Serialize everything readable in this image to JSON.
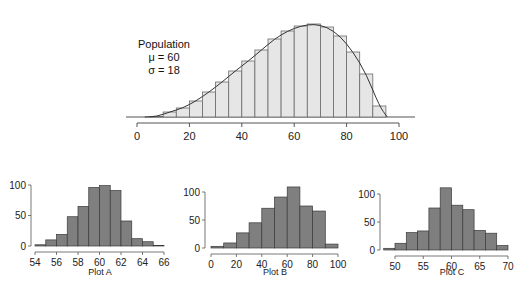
{
  "chart_data": [
    {
      "id": "population",
      "type": "bar",
      "title": "",
      "annotation": [
        "Population",
        "μ = 60",
        "σ = 18"
      ],
      "xlabel": "",
      "ylabel": "",
      "xlim": [
        0,
        100
      ],
      "x_ticks": [
        "0",
        "20",
        "40",
        "60",
        "80",
        "100"
      ],
      "bin_width": 5,
      "bin_starts": [
        5,
        10,
        15,
        20,
        25,
        30,
        35,
        40,
        45,
        50,
        55,
        60,
        65,
        70,
        75,
        80,
        85,
        90
      ],
      "values": [
        0.5,
        5,
        9,
        16,
        25,
        35,
        46,
        56,
        67,
        78,
        86,
        91,
        93,
        90,
        81,
        65,
        43,
        11
      ],
      "density_curve": true,
      "y_axis_shown": false,
      "grid": false
    },
    {
      "id": "plot-a",
      "type": "bar",
      "title": "Plot A",
      "xlim": [
        54,
        66
      ],
      "ylim": [
        0,
        100
      ],
      "x_ticks": [
        "54",
        "56",
        "58",
        "60",
        "62",
        "64",
        "66"
      ],
      "y_ticks": [
        "0",
        "50",
        "100"
      ],
      "bin_width": 1,
      "bin_starts": [
        54,
        55,
        56,
        57,
        58,
        59,
        60,
        61,
        62,
        63,
        64,
        65
      ],
      "values": [
        2,
        10,
        19,
        48,
        65,
        96,
        99,
        91,
        41,
        12,
        7,
        1
      ],
      "grid": false
    },
    {
      "id": "plot-b",
      "type": "bar",
      "title": "Plot B",
      "xlim": [
        0,
        100
      ],
      "ylim": [
        0,
        100
      ],
      "x_ticks": [
        "0",
        "20",
        "40",
        "60",
        "80",
        "100"
      ],
      "y_ticks": [
        "0",
        "50",
        "100"
      ],
      "bin_width": 10,
      "bin_starts": [
        0,
        10,
        20,
        30,
        40,
        50,
        60,
        70,
        80,
        90
      ],
      "values": [
        3,
        9,
        27,
        45,
        71,
        91,
        109,
        75,
        66,
        7
      ],
      "grid": false
    },
    {
      "id": "plot-c",
      "type": "bar",
      "title": "Plot C",
      "xlim": [
        50,
        70
      ],
      "ylim": [
        0,
        100
      ],
      "x_ticks": [
        "50",
        "55",
        "60",
        "65",
        "70"
      ],
      "y_ticks": [
        "0",
        "50",
        "100"
      ],
      "bin_width": 2,
      "bin_starts": [
        48,
        50,
        52,
        54,
        56,
        58,
        60,
        62,
        64,
        66,
        68
      ],
      "values": [
        3,
        12,
        31,
        34,
        75,
        111,
        80,
        72,
        35,
        30,
        8
      ],
      "grid": false
    }
  ],
  "colors": {
    "population_bar": "#e6e6e6",
    "sample_bar": "#7f7f7f",
    "bar_edge": "#3a3a3a",
    "axis": "#555555",
    "curve": "#333333"
  }
}
